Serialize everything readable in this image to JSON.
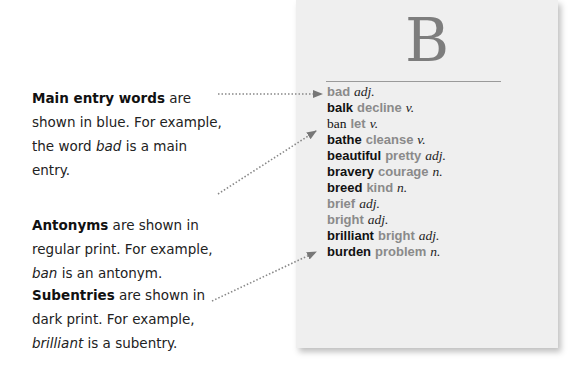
{
  "glossary_page": {
    "letter": "B",
    "entries": [
      {
        "word": "bad",
        "type": "main",
        "synonym": "",
        "pos": "adj."
      },
      {
        "word": "balk",
        "type": "subentry",
        "synonym": "decline",
        "pos": "v."
      },
      {
        "word": "ban",
        "type": "antonym",
        "synonym": "let",
        "pos": "v."
      },
      {
        "word": "bathe",
        "type": "subentry",
        "synonym": "cleanse",
        "pos": "v."
      },
      {
        "word": "beautiful",
        "type": "subentry",
        "synonym": "pretty",
        "pos": "adj."
      },
      {
        "word": "bravery",
        "type": "subentry",
        "synonym": "courage",
        "pos": "n."
      },
      {
        "word": "breed",
        "type": "subentry",
        "synonym": "kind",
        "pos": "n."
      },
      {
        "word": "brief",
        "type": "main",
        "synonym": "",
        "pos": "adj."
      },
      {
        "word": "bright",
        "type": "main",
        "synonym": "",
        "pos": "adj."
      },
      {
        "word": "brilliant",
        "type": "subentry",
        "synonym": "bright",
        "pos": "adj."
      },
      {
        "word": "burden",
        "type": "subentry",
        "synonym": "problem",
        "pos": "n."
      }
    ]
  },
  "annotations": [
    {
      "bold": "Main entry words",
      "line1_rest": " are",
      "line2": "shown in blue. For example,",
      "line3_pre": "the word ",
      "line3_ital": "bad",
      "line3_post": " is a main",
      "line4": "entry."
    },
    {
      "bold": "Antonyms",
      "line1_rest": " are shown in",
      "line2": "regular print. For example,",
      "line3_pre": "",
      "line3_ital": "ban",
      "line3_post": " is an antonym.",
      "line4": ""
    },
    {
      "bold": "Subentries",
      "line1_rest": " are shown in",
      "line2": "dark print. For example,",
      "line3_pre": "",
      "line3_ital": "brilliant",
      "line3_post": " is a subentry.",
      "line4": ""
    }
  ],
  "colors": {
    "paper": "#efefef",
    "main_entry": "#8a8a8a",
    "letter": "#7d7d7d",
    "arrow": "#777777"
  }
}
